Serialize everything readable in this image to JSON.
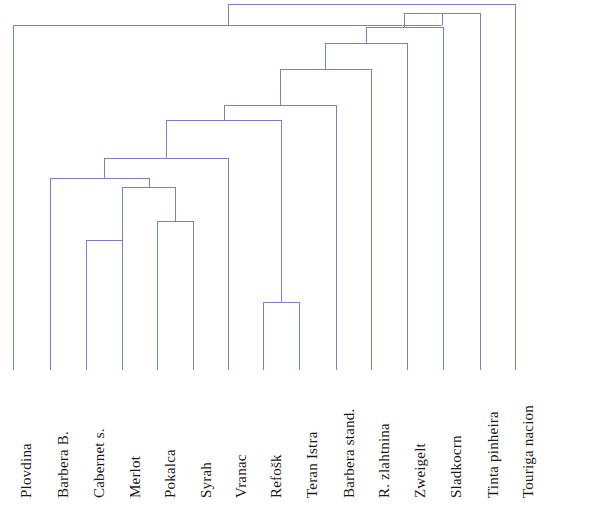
{
  "figure": {
    "type": "dendrogram",
    "title": "",
    "background_color": "#ffffff",
    "line_color": "#7b80c6",
    "label_color": "#1a1a1a",
    "width": 614,
    "height": 506
  },
  "leaves": [
    {
      "label": "Plovdina",
      "x": 13
    },
    {
      "label": "Barbera B.",
      "x": 50
    },
    {
      "label": "Cabernet s.",
      "x": 86
    },
    {
      "label": "Merlot",
      "x": 122
    },
    {
      "label": "Pokalca",
      "x": 157
    },
    {
      "label": "Syrah",
      "x": 193
    },
    {
      "label": "Vranac",
      "x": 228
    },
    {
      "label": "Refošk",
      "x": 263
    },
    {
      "label": "Teran Istra",
      "x": 299
    },
    {
      "label": "Barbera stand.",
      "x": 336
    },
    {
      "label": "R. zlahtnina",
      "x": 371
    },
    {
      "label": "Zweigelt",
      "x": 407
    },
    {
      "label": "Sladkocrn",
      "x": 443
    },
    {
      "label": "Tinta pinheira",
      "x": 480
    },
    {
      "label": "Touriga nacion",
      "x": 515
    }
  ],
  "chart_data": {
    "type": "dendrogram",
    "title": "",
    "xlabel": "",
    "ylabel": "",
    "orientation": "top-down",
    "baseline_y": 370,
    "leaf_order": [
      "Plovdina",
      "Barbera B.",
      "Cabernet s.",
      "Merlot",
      "Pokalca",
      "Syrah",
      "Vranac",
      "Refošk",
      "Teran Istra",
      "Barbera stand.",
      "R. zlahtnina",
      "Zweigelt",
      "Sladkocrn",
      "Tinta pinheira",
      "Touriga nacion"
    ],
    "merges": [
      {
        "id": "m1",
        "left": "Cabernet s.",
        "right": "Merlot",
        "x": 122,
        "y": 240
      },
      {
        "id": "m2",
        "left": "Pokalca",
        "right": "Syrah",
        "x": 175,
        "y": 221
      },
      {
        "id": "m3",
        "left": "Refošk",
        "right": "Teran Istra",
        "x": 281,
        "y": 302
      },
      {
        "id": "m4",
        "left": "m1",
        "right": "m2",
        "x": 149,
        "y": 187
      },
      {
        "id": "m5",
        "left": "Barbera B.",
        "right": "m4",
        "x": 104,
        "y": 178
      },
      {
        "id": "m6",
        "left": "m5",
        "right": "Vranac",
        "x": 166,
        "y": 158
      },
      {
        "id": "m7",
        "left": "m6",
        "right": "m3",
        "x": 224,
        "y": 120
      },
      {
        "id": "m8",
        "left": "m7",
        "right": "Barbera stand.",
        "x": 280,
        "y": 105
      },
      {
        "id": "m9",
        "left": "m8",
        "right": "R. zlahtnina",
        "x": 325,
        "y": 69
      },
      {
        "id": "m10",
        "left": "m9",
        "right": "Zweigelt",
        "x": 366,
        "y": 43
      },
      {
        "id": "m11",
        "left": "m10",
        "right": "Sladkocrn",
        "x": 404,
        "y": 27
      },
      {
        "id": "m12",
        "left": "m11",
        "right": "Tinta pinheira",
        "x": 442,
        "y": 13
      },
      {
        "id": "m13",
        "left": "Plovdina",
        "right": "m12",
        "x": 228,
        "y": 25
      },
      {
        "id": "m14",
        "left": "m13",
        "right": "Touriga nacion",
        "x": 372,
        "y": 4
      }
    ]
  }
}
